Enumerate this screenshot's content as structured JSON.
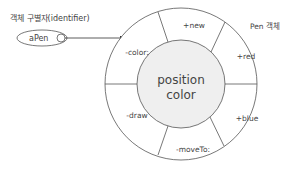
{
  "identifier_label": "객체 구별자(identifier)",
  "identifier_name": "aPen",
  "object_label": "Pen 객체",
  "center": {
    "line1": "position",
    "line2": "color"
  },
  "methods": {
    "top": "+new",
    "top_right": "+red",
    "right": "+blue",
    "bottom": "-moveTo:",
    "bottom_left": "-draw",
    "top_left": "-color:"
  },
  "colors": {
    "stroke": "#555555",
    "inner_fill": "#efefef",
    "text": "#444444"
  }
}
